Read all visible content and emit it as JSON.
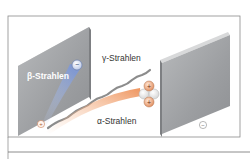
{
  "diagram": {
    "labels": {
      "beta": "β-Strahlen",
      "gamma": "γ-Strahlen",
      "alpha": "α-Strahlen"
    },
    "plates": {
      "left_charge": "+",
      "right_charge": "−"
    },
    "particles": {
      "beta_symbol": "−",
      "alpha_proton_symbol": "+"
    },
    "colors": {
      "frame": "#7a7a7a",
      "plate_face": "#a6a8aa",
      "plate_edge": "#d8d9da",
      "beta_ray": "#8fa6d8",
      "gamma_ray": "#8a8a8a",
      "alpha_ray": "#f0a070",
      "proton": "#e79a6e",
      "neutron": "#f4f4f4",
      "label_text": "#333333",
      "beta_label_text": "#ffffff"
    }
  }
}
